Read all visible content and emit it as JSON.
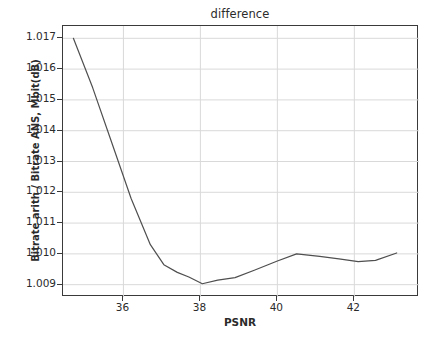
{
  "chart_data": {
    "type": "line",
    "title": "difference",
    "xlabel": "PSNR",
    "ylabel": "Bitrate arith / Bitrate ANS, Mbit(dB)",
    "grid": true,
    "legend": "none",
    "xlim": [
      34.43,
      43.68
    ],
    "ylim": [
      1.0086,
      1.0174
    ],
    "xticks": [
      36,
      38,
      40,
      42
    ],
    "xtick_labels": [
      "36",
      "38",
      "40",
      "42"
    ],
    "yticks": [
      1.009,
      1.01,
      1.011,
      1.012,
      1.013,
      1.014,
      1.015,
      1.016,
      1.017
    ],
    "ytick_labels": [
      "1.009",
      "1.010",
      "1.011",
      "1.012",
      "1.013",
      "1.014",
      "1.015",
      "1.016",
      "1.017"
    ],
    "series": [
      {
        "name": "difference",
        "color": "#4f4f4f",
        "linewidth": 1.2,
        "x": [
          34.7,
          35.2,
          35.7,
          36.2,
          36.7,
          37.05,
          37.4,
          37.7,
          38.05,
          38.45,
          38.9,
          39.4,
          40.0,
          40.5,
          41.1,
          41.6,
          42.1,
          42.55,
          43.1
        ],
        "y": [
          1.017,
          1.0154,
          1.0136,
          1.0118,
          1.0103,
          1.00965,
          1.0094,
          1.00925,
          1.00903,
          1.00915,
          1.00923,
          1.00947,
          1.00977,
          1.01,
          1.00992,
          1.00984,
          1.00975,
          1.00979,
          1.01003
        ]
      }
    ]
  }
}
